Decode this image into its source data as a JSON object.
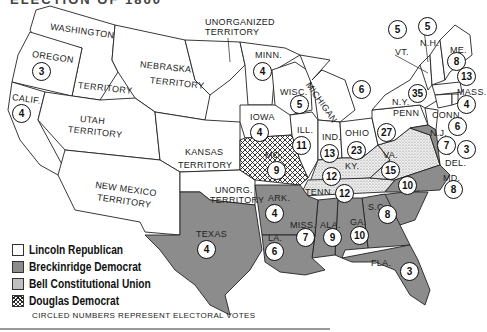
{
  "title_partial": "ELECTION OF 1860",
  "colors": {
    "lincoln": "#ffffff",
    "breckinridge": "#8c8c8c",
    "bell": "stippled",
    "douglas": "crosshatch",
    "border": "#222222"
  },
  "legend": {
    "items": [
      {
        "key": "lincoln",
        "label": "Lincoln Republican"
      },
      {
        "key": "breck",
        "label": "Breckinridge Democrat"
      },
      {
        "key": "bell",
        "label": "Bell Constitutional Union"
      },
      {
        "key": "douglas",
        "label": "Douglas Democrat"
      }
    ],
    "note": "CIRCLED NUMBERS REPRESENT ELECTORAL VOTES"
  },
  "territories": {
    "washington": "WASHINGTON",
    "washington2": "TERRITORY",
    "nebraska": "NEBRASKA",
    "nebraska2": "TERRITORY",
    "unorganized": "UNORGANIZED",
    "unorganized2": "TERRITORY",
    "utah": "UTAH",
    "utah2": "TERRITORY",
    "kansas": "KANSAS",
    "kansas2": "TERRITORY",
    "newmexico": "NEW MEXICO",
    "newmexico2": "TERRITORY",
    "unorg": "UNORG.",
    "unorg2": "TERRITORY"
  },
  "states": {
    "oregon": {
      "label": "OREGON",
      "votes": "3",
      "party": "lincoln"
    },
    "calif": {
      "label": "CALIF.",
      "votes": "4",
      "party": "lincoln"
    },
    "minn": {
      "label": "MINN.",
      "votes": "4",
      "party": "lincoln"
    },
    "wisc": {
      "label": "WISC.",
      "votes": "5",
      "party": "lincoln"
    },
    "mich": {
      "label": "MICHIGAN",
      "votes": "6",
      "party": "lincoln"
    },
    "iowa": {
      "label": "IOWA",
      "votes": "4",
      "party": "lincoln"
    },
    "ill": {
      "label": "ILL.",
      "votes": "11",
      "party": "lincoln"
    },
    "ind": {
      "label": "IND.",
      "votes": "13",
      "party": "lincoln"
    },
    "ohio": {
      "label": "OHIO",
      "votes": "23",
      "party": "lincoln"
    },
    "mo": {
      "label": "MO.",
      "votes": "9",
      "party": "douglas"
    },
    "ky": {
      "label": "KY.",
      "votes": "12",
      "party": "bell"
    },
    "tenn": {
      "label": "TENN.",
      "votes": "12",
      "party": "bell"
    },
    "va": {
      "label": "VA.",
      "votes": "15",
      "party": "bell"
    },
    "penn": {
      "label": "PENN",
      "votes": "27",
      "party": "lincoln"
    },
    "ny": {
      "label": "N.Y.",
      "votes": "35",
      "party": "lincoln"
    },
    "vt": {
      "label": "VT.",
      "votes": "5",
      "party": "lincoln"
    },
    "nh": {
      "label": "N.H.",
      "votes": "5",
      "party": "lincoln"
    },
    "me": {
      "label": "ME.",
      "votes": "8",
      "party": "lincoln"
    },
    "mass": {
      "label": "MASS.",
      "votes": "13",
      "party": "lincoln"
    },
    "ri": {
      "label": "R.I.",
      "votes": "4",
      "party": "lincoln"
    },
    "conn": {
      "label": "CONN.",
      "votes": "6",
      "party": "lincoln"
    },
    "nj": {
      "label": "N.J.",
      "votes": "7",
      "party": "lincoln"
    },
    "del": {
      "label": "DEL.",
      "votes": "3",
      "party": "breckinridge"
    },
    "md": {
      "label": "MD.",
      "votes": "8",
      "party": "breckinridge"
    },
    "nc": {
      "label": "N.C.",
      "votes": "10",
      "party": "breckinridge"
    },
    "sc": {
      "label": "S.C.",
      "votes": "8",
      "party": "breckinridge"
    },
    "ga": {
      "label": "GA.",
      "votes": "10",
      "party": "breckinridge"
    },
    "fla": {
      "label": "FLA.",
      "votes": "3",
      "party": "breckinridge"
    },
    "ala": {
      "label": "ALA.",
      "votes": "9",
      "party": "breckinridge"
    },
    "miss": {
      "label": "MISS.",
      "votes": "7",
      "party": "breckinridge"
    },
    "la": {
      "label": "LA.",
      "votes": "6",
      "party": "breckinridge"
    },
    "ark": {
      "label": "ARK.",
      "votes": "4",
      "party": "breckinridge"
    },
    "texas": {
      "label": "TEXAS",
      "votes": "4",
      "party": "breckinridge"
    }
  }
}
